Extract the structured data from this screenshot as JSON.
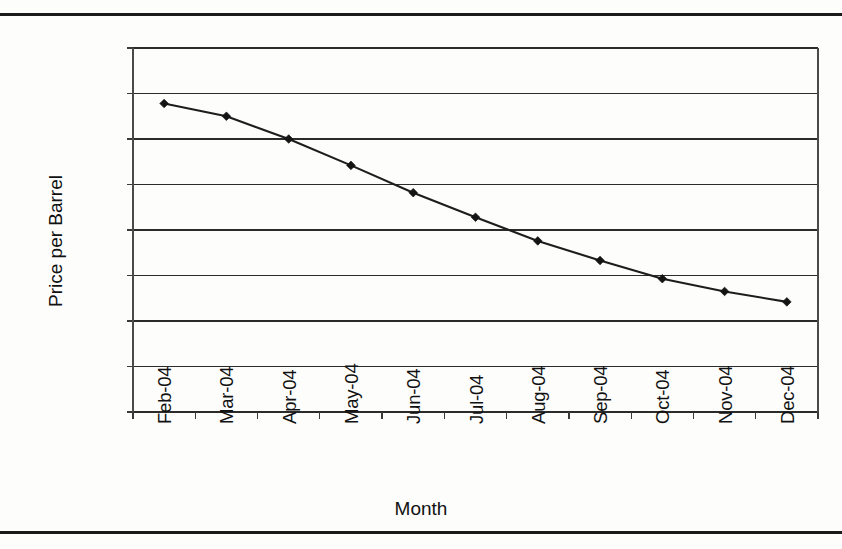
{
  "chart_data": {
    "type": "line",
    "title": "",
    "xlabel": "Month",
    "ylabel": "Price per Barrel",
    "categories": [
      "Feb-04",
      "Mar-04",
      "Apr-04",
      "May-04",
      "Jun-04",
      "Jul-04",
      "Aug-04",
      "Sep-04",
      "Oct-04",
      "Nov-04",
      "Dec-04"
    ],
    "series": [
      {
        "name": "Price per Barrel",
        "values": [
          33.78,
          33.5,
          33.0,
          32.42,
          31.82,
          31.28,
          30.76,
          30.33,
          29.93,
          29.65,
          29.42
        ]
      }
    ],
    "ylim": [
      27.0,
      35.0
    ],
    "ytick_values": [
      35.0,
      34.0,
      33.0,
      32.0,
      31.0,
      30.0,
      29.0,
      28.0,
      27.0
    ],
    "ytick_labels": [
      "$35.00",
      "$34.00",
      "$33.00",
      "$32.00",
      "$31.00",
      "$30.00",
      "$29.00",
      "$28.00",
      "$27.00"
    ],
    "grid": "horizontal",
    "legend": "none",
    "marker": "diamond",
    "line_color": "#1d1d1d",
    "marker_color": "#141414",
    "grid_color": "#2b2b2b",
    "background_color": "#ffffff"
  },
  "page": {
    "rule_top_label": "horizontal-rule",
    "rule_bottom_label": "horizontal-rule"
  }
}
